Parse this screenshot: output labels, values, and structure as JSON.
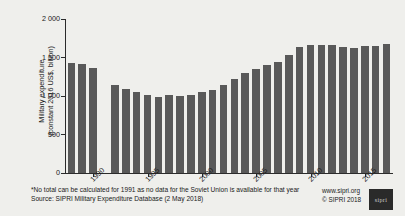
{
  "chart_data": {
    "type": "bar",
    "title": "",
    "xlabel": "",
    "ylabel": "Military expenditure\n(constant 2016 US$, billion)",
    "ylim": [
      0,
      2000
    ],
    "ytick_labels": [
      "0",
      "500",
      "1 000",
      "1 500",
      "2 000"
    ],
    "ytick_values": [
      0,
      500,
      1000,
      1500,
      2000
    ],
    "xtick_labels": [
      "1990",
      "1995",
      "2000",
      "2005",
      "2010",
      "2015"
    ],
    "xtick_values": [
      1990,
      1995,
      2000,
      2005,
      2010,
      2015
    ],
    "grid": false,
    "legend": "none",
    "bar_color": "#595959",
    "categories": [
      1988,
      1989,
      1990,
      1991,
      1992,
      1993,
      1994,
      1995,
      1996,
      1997,
      1998,
      1999,
      2000,
      2001,
      2002,
      2003,
      2004,
      2005,
      2006,
      2007,
      2008,
      2009,
      2010,
      2011,
      2012,
      2013,
      2014,
      2015,
      2016,
      2017
    ],
    "values": [
      1432,
      1412,
      1358,
      null,
      1139,
      1092,
      1056,
      1011,
      992,
      1010,
      995,
      1015,
      1046,
      1073,
      1141,
      1218,
      1296,
      1352,
      1397,
      1447,
      1528,
      1637,
      1661,
      1669,
      1657,
      1634,
      1624,
      1644,
      1648,
      1673
    ],
    "annotations": [
      "*No total can be calculated for 1991 as no data for the Soviet Union is available for that year"
    ]
  },
  "footer": {
    "footnote": "*No total can be calculated for 1991 as no data for the Soviet Union is available for that year",
    "source": "Source: SIPRI Military Expenditure Database (2 May 2018)",
    "website": "www.sipri.org",
    "copyright": "© SIPRI 2018",
    "logo_text": "sipri"
  }
}
